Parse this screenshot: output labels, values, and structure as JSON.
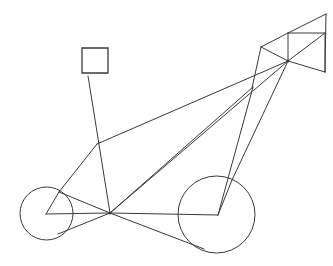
{
  "figure": {
    "title": "Wireframe line drawing",
    "background_color": "#ffffff",
    "stroke_color": "#3a3a3a",
    "stroke_width": 1,
    "canvas": {
      "width": 333,
      "height": 266
    }
  },
  "shapes": {
    "left_wheel": {
      "name": "left-wheel-circle",
      "cx": 46.5,
      "cy": 213.5,
      "r": 26.5
    },
    "right_wheel": {
      "name": "right-wheel-circle",
      "cx": 216.5,
      "cy": 214.5,
      "r": 38.5
    },
    "flag_square": {
      "name": "flag-square",
      "x": 82,
      "y": 48,
      "width": 26,
      "height": 25
    }
  },
  "nodes": {
    "hub": {
      "label": "central-hub",
      "x": 110,
      "y": 213
    },
    "left_hub": {
      "label": "left-wheel-hub",
      "x": 46,
      "y": 214
    },
    "right_hub": {
      "label": "right-wheel-hub",
      "x": 218,
      "y": 215
    },
    "mid_joint": {
      "label": "mid-frame-joint",
      "x": 97,
      "y": 144
    },
    "left_rim_upper": {
      "label": "left-rim-upper-contact",
      "x": 59,
      "y": 192
    },
    "left_rim_lower": {
      "label": "left-rim-lower-contact",
      "x": 58,
      "y": 234
    },
    "truss_hub": {
      "label": "truss-lower-hub",
      "x": 288,
      "y": 61
    },
    "truss_apex": {
      "label": "truss-apex",
      "x": 326,
      "y": 14
    },
    "truss_top_mid": {
      "label": "truss-top-mid",
      "x": 288,
      "y": 33
    },
    "truss_left": {
      "label": "truss-left-corner",
      "x": 261,
      "y": 47
    },
    "truss_right_upper": {
      "label": "truss-right-upper",
      "x": 325,
      "y": 33
    },
    "truss_right_lower": {
      "label": "truss-right-lower",
      "x": 325,
      "y": 72
    },
    "flag_pole_base": {
      "label": "flag-pole-base",
      "x": 88,
      "y": 76
    },
    "rear_stay_top": {
      "label": "rear-stay-top",
      "x": 253,
      "y": 87
    },
    "lower_right_contact": {
      "label": "lower-right-rim-contact",
      "x": 204,
      "y": 249
    },
    "right_rim_upper": {
      "label": "right-rim-upper-contact",
      "x": 232,
      "y": 180
    }
  },
  "edges": [
    {
      "name": "flag-pole",
      "from": [
        88,
        76
      ],
      "to": [
        110,
        213
      ]
    },
    {
      "name": "down-tube-upper",
      "from": [
        97,
        144
      ],
      "to": [
        288,
        61
      ]
    },
    {
      "name": "seat-stay-left",
      "from": [
        97,
        144
      ],
      "to": [
        59,
        192
      ]
    },
    {
      "name": "fork-left-upper",
      "from": [
        59,
        192
      ],
      "to": [
        110,
        213
      ]
    },
    {
      "name": "left-hub-spoke-upper",
      "from": [
        46,
        214
      ],
      "to": [
        59,
        192
      ]
    },
    {
      "name": "left-hub-axle",
      "from": [
        46,
        214
      ],
      "to": [
        110,
        213
      ]
    },
    {
      "name": "left-rim-lower-chord",
      "from": [
        58,
        234
      ],
      "to": [
        110,
        213
      ]
    },
    {
      "name": "hub-to-truss-hub",
      "from": [
        110,
        213
      ],
      "to": [
        288,
        61
      ]
    },
    {
      "name": "hub-to-rear-stay",
      "from": [
        110,
        213
      ],
      "to": [
        253,
        87
      ]
    },
    {
      "name": "chain-line-lower",
      "from": [
        110,
        213
      ],
      "to": [
        204,
        249
      ]
    },
    {
      "name": "hub-to-right-hub",
      "from": [
        110,
        213
      ],
      "to": [
        218,
        215
      ]
    },
    {
      "name": "right-hub-to-rim-upper",
      "from": [
        218,
        215
      ],
      "to": [
        232,
        180
      ]
    },
    {
      "name": "right-hub-stay",
      "from": [
        218,
        215
      ],
      "to": [
        253,
        87
      ]
    },
    {
      "name": "truss-hub-to-right-rim",
      "from": [
        288,
        61
      ],
      "to": [
        232,
        180
      ]
    },
    {
      "name": "truss-hub-to-right-lower",
      "from": [
        288,
        61
      ],
      "to": [
        325,
        72
      ]
    },
    {
      "name": "truss-hub-to-right-upper",
      "from": [
        288,
        61
      ],
      "to": [
        325,
        33
      ]
    },
    {
      "name": "truss-hub-to-top-mid",
      "from": [
        288,
        61
      ],
      "to": [
        288,
        33
      ]
    },
    {
      "name": "truss-hub-to-left",
      "from": [
        288,
        61
      ],
      "to": [
        261,
        47
      ]
    },
    {
      "name": "truss-left-to-top-mid",
      "from": [
        261,
        47
      ],
      "to": [
        288,
        33
      ]
    },
    {
      "name": "truss-top-mid-to-apex",
      "from": [
        288,
        33
      ],
      "to": [
        326,
        14
      ]
    },
    {
      "name": "truss-top-mid-to-right-upper",
      "from": [
        288,
        33
      ],
      "to": [
        325,
        33
      ]
    },
    {
      "name": "truss-apex-to-right-lower",
      "from": [
        326,
        14
      ],
      "to": [
        325,
        72
      ]
    },
    {
      "name": "truss-right-upper-to-lower",
      "from": [
        325,
        33
      ],
      "to": [
        325,
        72
      ]
    },
    {
      "name": "truss-left-to-lower-leg",
      "from": [
        261,
        47
      ],
      "to": [
        252,
        88
      ]
    }
  ],
  "annotations": {
    "node_markers": [
      {
        "label": "central-hub-marker",
        "x": 110,
        "y": 213,
        "r": 1.6
      },
      {
        "label": "truss-hub-marker",
        "x": 288,
        "y": 61,
        "r": 1.4
      }
    ]
  }
}
